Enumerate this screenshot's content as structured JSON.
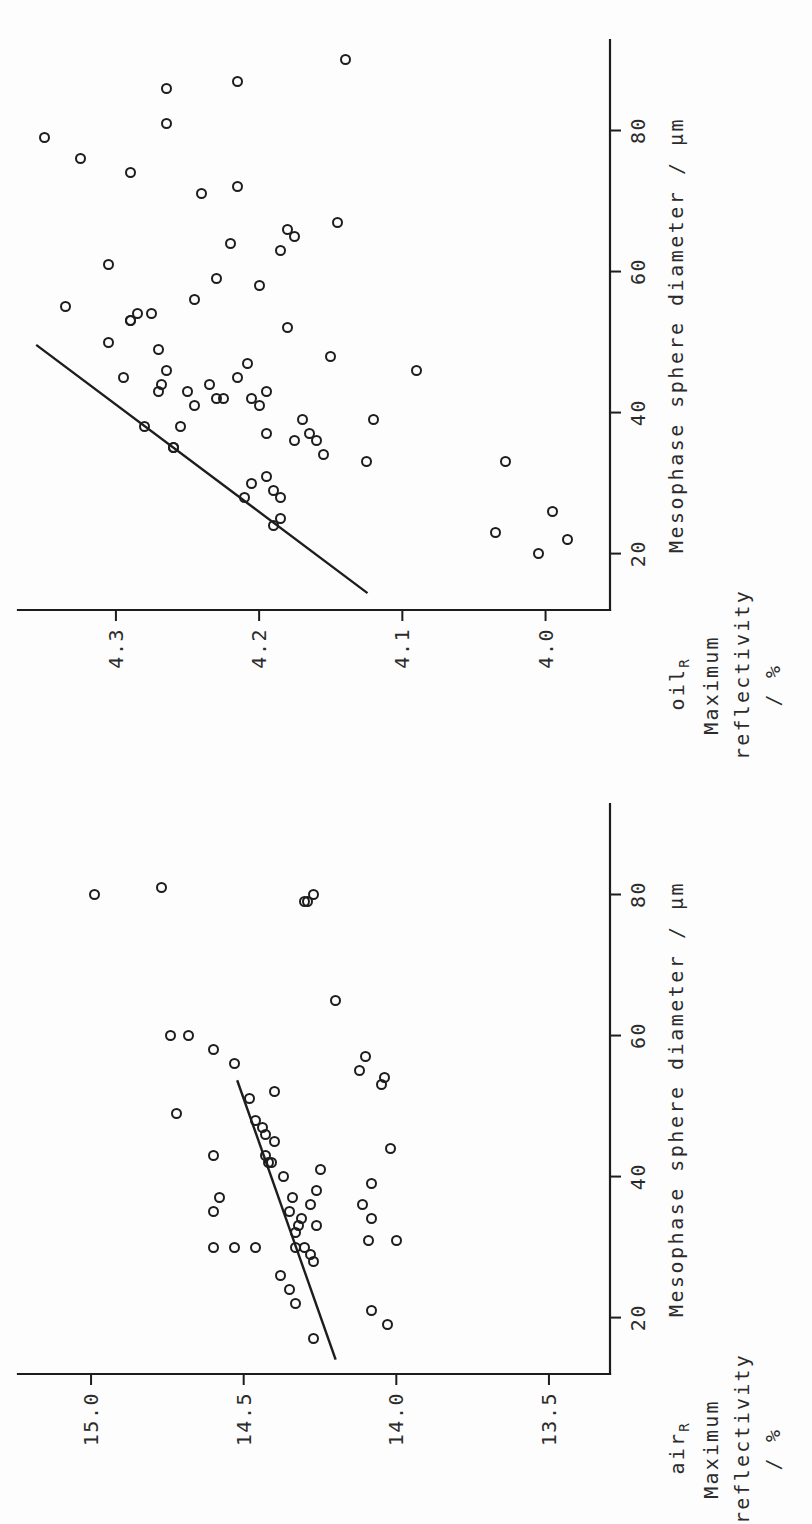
{
  "figure": {
    "orientation": "rotated-90-ccw",
    "background_color": "#fdfdfd",
    "ink_color": "#1d1d1d"
  },
  "chart_data": [
    {
      "id": "oil",
      "type": "scatter",
      "title": "",
      "xlabel": "Mesophase sphere diameter / µm",
      "ylabel_line1": "oil",
      "ylabel_sub": "R",
      "ylabel_line2": "Maximum",
      "ylabel_line3": "reflectivity",
      "ylabel_line4": "/ %",
      "xlim": [
        12,
        90
      ],
      "ylim": [
        3.955,
        4.36
      ],
      "xticks": [
        20,
        40,
        60,
        80
      ],
      "xtick_labels": [
        "20",
        "40",
        "60",
        "80"
      ],
      "yticks": [
        4.0,
        4.1,
        4.2,
        4.3
      ],
      "ytick_labels": [
        "4.0",
        "4.1",
        "4.2",
        "4.3"
      ],
      "grid": false,
      "legend": "none",
      "marker": "open-circle",
      "x": [
        30,
        31,
        37,
        20,
        22,
        26,
        23,
        24,
        25,
        28,
        28,
        29,
        33,
        33,
        34,
        35,
        35,
        36,
        36,
        37,
        38,
        38,
        39,
        39,
        41,
        41,
        42,
        42,
        42,
        43,
        43,
        43,
        44,
        44,
        45,
        45,
        46,
        46,
        47,
        48,
        49,
        50,
        52,
        53,
        53,
        54,
        54,
        55,
        56,
        58,
        59,
        61,
        63,
        64,
        65,
        66,
        67,
        71,
        72,
        74,
        76,
        79,
        81,
        86,
        87,
        90
      ],
      "y": [
        4.205,
        4.195,
        4.195,
        4.005,
        3.985,
        3.995,
        4.035,
        4.19,
        4.185,
        4.21,
        4.185,
        4.19,
        4.028,
        4.125,
        4.155,
        4.26,
        4.26,
        4.175,
        4.16,
        4.165,
        4.255,
        4.28,
        4.17,
        4.12,
        4.245,
        4.2,
        4.225,
        4.23,
        4.205,
        4.27,
        4.25,
        4.195,
        4.268,
        4.235,
        4.295,
        4.215,
        4.265,
        4.09,
        4.208,
        4.15,
        4.27,
        4.305,
        4.18,
        4.29,
        4.29,
        4.285,
        4.275,
        4.335,
        4.245,
        4.2,
        4.23,
        4.305,
        4.185,
        4.22,
        4.175,
        4.18,
        4.145,
        4.24,
        4.215,
        4.29,
        4.325,
        4.35,
        4.265,
        4.265,
        4.215,
        4.14
      ],
      "trend_line": {
        "x": [
          14.5,
          49.5
        ],
        "y": [
          4.125,
          4.355
        ]
      }
    },
    {
      "id": "air",
      "type": "scatter",
      "title": "",
      "xlabel": "Mesophase sphere diameter / µm",
      "ylabel_line1": "air",
      "ylabel_sub": "R",
      "ylabel_line2": "Maximum",
      "ylabel_line3": "reflectivity",
      "ylabel_line4": "/ %",
      "xlim": [
        12,
        90
      ],
      "ylim": [
        13.3,
        15.2
      ],
      "xticks": [
        20,
        40,
        60,
        80
      ],
      "xtick_labels": [
        "20",
        "40",
        "60",
        "80"
      ],
      "yticks": [
        13.5,
        14.0,
        14.5,
        15.0
      ],
      "ytick_labels": [
        "13.5",
        "14.0",
        "14.5",
        "15.0"
      ],
      "grid": false,
      "legend": "none",
      "marker": "open-circle",
      "x": [
        17,
        19,
        21,
        22,
        24,
        26,
        28,
        29,
        30,
        30,
        30,
        30,
        30,
        31,
        31,
        32,
        33,
        33,
        34,
        34,
        35,
        35,
        36,
        36,
        37,
        37,
        38,
        39,
        40,
        41,
        42,
        42,
        43,
        43,
        44,
        45,
        46,
        47,
        48,
        49,
        51,
        52,
        53,
        54,
        55,
        56,
        57,
        58,
        60,
        60,
        65,
        79,
        79,
        80,
        80,
        81
      ],
      "y": [
        14.27,
        14.03,
        14.08,
        14.33,
        14.35,
        14.38,
        14.27,
        14.28,
        14.3,
        14.33,
        14.46,
        14.53,
        14.6,
        14.09,
        14.0,
        14.33,
        14.32,
        14.26,
        14.31,
        14.08,
        14.35,
        14.6,
        14.28,
        14.11,
        14.34,
        14.58,
        14.26,
        14.08,
        14.37,
        14.25,
        14.42,
        14.41,
        14.43,
        14.6,
        14.02,
        14.4,
        14.43,
        14.44,
        14.46,
        14.72,
        14.48,
        14.4,
        14.05,
        14.04,
        14.12,
        14.53,
        14.1,
        14.6,
        14.68,
        14.74,
        14.2,
        14.29,
        14.3,
        14.27,
        14.99,
        14.77
      ],
      "trend_line": {
        "x": [
          14.2,
          53.5
        ],
        "y": [
          14.2,
          14.52
        ]
      }
    }
  ]
}
